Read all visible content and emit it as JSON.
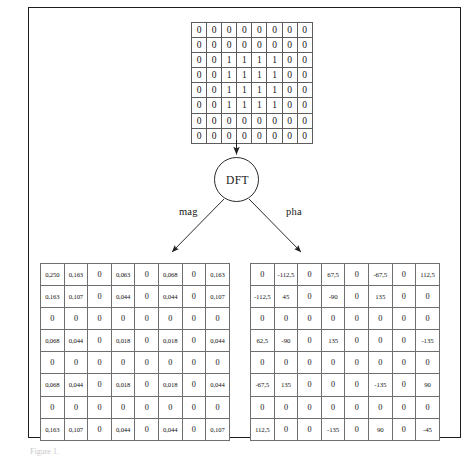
{
  "figure": {
    "caption": "Figure 1.",
    "process_label": "DFT",
    "branches": {
      "magnitude": "mag",
      "phase": "pha"
    }
  },
  "colors": {
    "frame": "#1d1d1d",
    "grid_line": "#6f6f6f",
    "text": "#141414",
    "background": "#ffffff"
  },
  "input_matrix": {
    "name": "input-image",
    "rows": 8,
    "cols": 8,
    "values": [
      [
        "0",
        "0",
        "0",
        "0",
        "0",
        "0",
        "0",
        "0"
      ],
      [
        "0",
        "0",
        "0",
        "0",
        "0",
        "0",
        "0",
        "0"
      ],
      [
        "0",
        "0",
        "1",
        "1",
        "1",
        "1",
        "0",
        "0"
      ],
      [
        "0",
        "0",
        "1",
        "1",
        "1",
        "1",
        "0",
        "0"
      ],
      [
        "0",
        "0",
        "1",
        "1",
        "1",
        "1",
        "0",
        "0"
      ],
      [
        "0",
        "0",
        "1",
        "1",
        "1",
        "1",
        "0",
        "0"
      ],
      [
        "0",
        "0",
        "0",
        "0",
        "0",
        "0",
        "0",
        "0"
      ],
      [
        "0",
        "0",
        "0",
        "0",
        "0",
        "0",
        "0",
        "0"
      ]
    ]
  },
  "magnitude_matrix": {
    "name": "magnitude",
    "rows": 8,
    "cols": 8,
    "values": [
      [
        "0,250",
        "0,163",
        "0",
        "0,063",
        "0",
        "0,068",
        "0",
        "0,163"
      ],
      [
        "0,163",
        "0,107",
        "0",
        "0,044",
        "0",
        "0,044",
        "0",
        "0,107"
      ],
      [
        "0",
        "0",
        "0",
        "0",
        "0",
        "0",
        "0",
        "0"
      ],
      [
        "0,068",
        "0,044",
        "0",
        "0,018",
        "0",
        "0,018",
        "0",
        "0,044"
      ],
      [
        "0",
        "0",
        "0",
        "0",
        "0",
        "0",
        "0",
        "0"
      ],
      [
        "0,068",
        "0,044",
        "0",
        "0,018",
        "0",
        "0,018",
        "0",
        "0,044"
      ],
      [
        "0",
        "0",
        "0",
        "0",
        "0",
        "0",
        "0",
        "0"
      ],
      [
        "0,163",
        "0,107",
        "0",
        "0,044",
        "0",
        "0,044",
        "0",
        "0,107"
      ]
    ]
  },
  "phase_matrix": {
    "name": "phase",
    "rows": 8,
    "cols": 8,
    "values": [
      [
        "0",
        "-112,5",
        "0",
        "67,5",
        "0",
        "-67,5",
        "0",
        "112,5"
      ],
      [
        "-112,5",
        "45",
        "0",
        "-90",
        "0",
        "135",
        "0",
        "0"
      ],
      [
        "0",
        "0",
        "0",
        "0",
        "0",
        "0",
        "0",
        "0"
      ],
      [
        "62,5",
        "-90",
        "0",
        "135",
        "0",
        "0",
        "0",
        "-135"
      ],
      [
        "0",
        "0",
        "0",
        "0",
        "0",
        "0",
        "0",
        "0"
      ],
      [
        "-67,5",
        "135",
        "0",
        "0",
        "0",
        "-135",
        "0",
        "90"
      ],
      [
        "0",
        "0",
        "0",
        "0",
        "0",
        "0",
        "0",
        "0"
      ],
      [
        "112,5",
        "0",
        "0",
        "-135",
        "0",
        "90",
        "0",
        "-45"
      ]
    ]
  },
  "chart_data": {
    "type": "heatmap",
    "panels": [
      {
        "name": "input image",
        "role": "input",
        "rows": 8,
        "cols": 8,
        "values": [
          [
            0,
            0,
            0,
            0,
            0,
            0,
            0,
            0
          ],
          [
            0,
            0,
            0,
            0,
            0,
            0,
            0,
            0
          ],
          [
            0,
            0,
            1,
            1,
            1,
            1,
            0,
            0
          ],
          [
            0,
            0,
            1,
            1,
            1,
            1,
            0,
            0
          ],
          [
            0,
            0,
            1,
            1,
            1,
            1,
            0,
            0
          ],
          [
            0,
            0,
            1,
            1,
            1,
            1,
            0,
            0
          ],
          [
            0,
            0,
            0,
            0,
            0,
            0,
            0,
            0
          ],
          [
            0,
            0,
            0,
            0,
            0,
            0,
            0,
            0
          ]
        ]
      },
      {
        "name": "mag",
        "role": "magnitude",
        "rows": 8,
        "cols": 8,
        "values": [
          [
            0.25,
            0.163,
            0,
            0.063,
            0,
            0.068,
            0,
            0.163
          ],
          [
            0.163,
            0.107,
            0,
            0.044,
            0,
            0.044,
            0,
            0.107
          ],
          [
            0,
            0,
            0,
            0,
            0,
            0,
            0,
            0
          ],
          [
            0.068,
            0.044,
            0,
            0.018,
            0,
            0.018,
            0,
            0.044
          ],
          [
            0,
            0,
            0,
            0,
            0,
            0,
            0,
            0
          ],
          [
            0.068,
            0.044,
            0,
            0.018,
            0,
            0.018,
            0,
            0.044
          ],
          [
            0,
            0,
            0,
            0,
            0,
            0,
            0,
            0
          ],
          [
            0.163,
            0.107,
            0,
            0.044,
            0,
            0.044,
            0,
            0.107
          ]
        ]
      },
      {
        "name": "pha",
        "role": "phase",
        "unit": "degrees",
        "rows": 8,
        "cols": 8,
        "values": [
          [
            0,
            -112.5,
            0,
            67.5,
            0,
            -67.5,
            0,
            112.5
          ],
          [
            -112.5,
            45,
            0,
            -90,
            0,
            135,
            0,
            0
          ],
          [
            0,
            0,
            0,
            0,
            0,
            0,
            0,
            0
          ],
          [
            62.5,
            -90,
            0,
            135,
            0,
            0,
            0,
            -135
          ],
          [
            0,
            0,
            0,
            0,
            0,
            0,
            0,
            0
          ],
          [
            -67.5,
            135,
            0,
            0,
            0,
            -135,
            0,
            90
          ],
          [
            0,
            0,
            0,
            0,
            0,
            0,
            0,
            0
          ],
          [
            112.5,
            0,
            0,
            -135,
            0,
            90,
            0,
            -45
          ]
        ]
      }
    ],
    "nodes": [
      {
        "label": "DFT",
        "shape": "circle"
      }
    ],
    "edges": [
      {
        "from": "input image",
        "to": "DFT",
        "label": ""
      },
      {
        "from": "DFT",
        "to": "mag",
        "label": "mag"
      },
      {
        "from": "DFT",
        "to": "pha",
        "label": "pha"
      }
    ]
  }
}
